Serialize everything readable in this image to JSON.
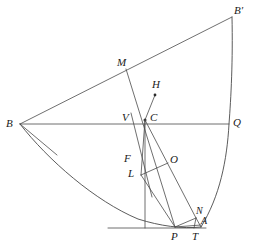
{
  "figure": {
    "type": "euclidean-construction",
    "canvas": {
      "width": 256,
      "height": 252
    },
    "stroke_color": "#4a4a4a",
    "label_color": "#1a1a1a",
    "background": "#ffffff",
    "labels": {
      "B": "B",
      "B_prime": "B′",
      "Q": "Q",
      "M": "M",
      "H": "H",
      "C": "C",
      "V": "V",
      "F": "F",
      "L": "L",
      "O": "O",
      "N": "N",
      "A": "A",
      "P": "P",
      "T": "T"
    },
    "points": {
      "B": {
        "x": 20,
        "y": 124
      },
      "B_prime": {
        "x": 232,
        "y": 17
      },
      "Q": {
        "x": 229,
        "y": 124
      },
      "M": {
        "x": 126,
        "y": 69
      },
      "H": {
        "x": 155,
        "y": 95
      },
      "C": {
        "x": 145,
        "y": 120
      },
      "V": {
        "x": 136,
        "y": 124
      },
      "F": {
        "x": 135,
        "y": 160
      },
      "L": {
        "x": 141,
        "y": 175
      },
      "O": {
        "x": 168,
        "y": 163
      },
      "N": {
        "x": 196,
        "y": 218
      },
      "A": {
        "x": 201,
        "y": 227
      },
      "P": {
        "x": 175,
        "y": 227
      },
      "T": {
        "x": 194,
        "y": 227
      }
    }
  }
}
